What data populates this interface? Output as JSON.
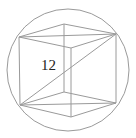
{
  "figure": {
    "diagonal_label": "12",
    "colors": {
      "stroke": "#9a9a9a",
      "label": "#222222",
      "background": "#ffffff"
    },
    "sphere": {
      "cx": 68,
      "cy": 70,
      "r": 61
    },
    "vertices": {
      "A_top_left": [
        19,
        37
      ],
      "B_top_back": [
        64,
        24
      ],
      "C_top_right": [
        116,
        34
      ],
      "D_top_front": [
        71,
        48
      ],
      "E_bottom_left": [
        20,
        105
      ],
      "F_bottom_back": [
        64,
        92
      ],
      "G_bottom_right": [
        116,
        103
      ],
      "H_bottom_front": [
        71,
        117
      ]
    },
    "edges": [
      [
        "A_top_left",
        "B_top_back"
      ],
      [
        "B_top_back",
        "C_top_right"
      ],
      [
        "A_top_left",
        "D_top_front"
      ],
      [
        "D_top_front",
        "C_top_right"
      ],
      [
        "E_bottom_left",
        "F_bottom_back"
      ],
      [
        "F_bottom_back",
        "G_bottom_right"
      ],
      [
        "E_bottom_left",
        "H_bottom_front"
      ],
      [
        "H_bottom_front",
        "G_bottom_right"
      ],
      [
        "A_top_left",
        "E_bottom_left"
      ],
      [
        "B_top_back",
        "F_bottom_back"
      ],
      [
        "C_top_right",
        "G_bottom_right"
      ],
      [
        "D_top_front",
        "H_bottom_front"
      ]
    ],
    "diagonals": [
      {
        "name": "top-face-diagonal",
        "from": "A_top_left",
        "to": "C_top_right"
      },
      {
        "name": "bottom-face-diagonal",
        "from": "E_bottom_left",
        "to": "G_bottom_right"
      },
      {
        "name": "space-diagonal",
        "from": "E_bottom_left",
        "to": "C_top_right"
      }
    ],
    "label_position": {
      "x": 41,
      "y": 58
    }
  }
}
